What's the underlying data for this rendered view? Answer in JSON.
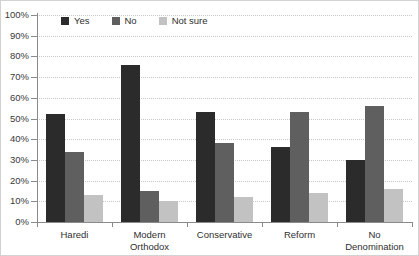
{
  "chart_data": {
    "type": "bar",
    "title": "",
    "subtitle": "",
    "xlabel": "",
    "ylabel": "",
    "ylim": [
      0,
      100
    ],
    "grid": true,
    "legend_position": "top-inside-left",
    "categories": [
      "Haredi",
      "Modern Orthodox",
      "Conservative",
      "Reform",
      "No Denomination"
    ],
    "category_lines": [
      [
        "Haredi"
      ],
      [
        "Modern",
        "Orthodox"
      ],
      [
        "Conservative"
      ],
      [
        "Reform"
      ],
      [
        "No",
        "Denomination"
      ]
    ],
    "y_ticks": [
      "0%",
      "10%",
      "20%",
      "30%",
      "40%",
      "50%",
      "60%",
      "70%",
      "80%",
      "90%",
      "100%"
    ],
    "y_tick_values": [
      0,
      10,
      20,
      30,
      40,
      50,
      60,
      70,
      80,
      90,
      100
    ],
    "series": [
      {
        "name": "Yes",
        "color": "#2b2b2b",
        "values": [
          52,
          76,
          53,
          36,
          30
        ]
      },
      {
        "name": "No",
        "color": "#5f5f5f",
        "values": [
          34,
          15,
          38,
          53,
          56
        ]
      },
      {
        "name": "Not sure",
        "color": "#c2c2c2",
        "values": [
          13,
          10,
          12,
          14,
          16
        ]
      }
    ]
  },
  "legend": {
    "items": [
      {
        "label": "Yes"
      },
      {
        "label": "No"
      },
      {
        "label": "Not sure"
      }
    ]
  },
  "axis": {
    "y_max_label": "100%",
    "y_min_label": "0%"
  },
  "colors": {
    "series_yes": "#2b2b2b",
    "series_no": "#5f5f5f",
    "series_not_sure": "#c2c2c2",
    "axis_line": "#8a8a8a",
    "gridline": "#c8c8c8",
    "border": "#d2d2d2",
    "background": "#ffffff",
    "text": "#2f2f2f"
  }
}
